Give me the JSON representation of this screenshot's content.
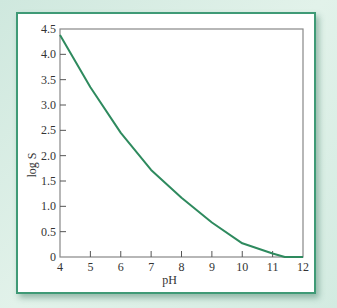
{
  "chart_data": {
    "type": "line",
    "title": "",
    "xlabel": "pH",
    "ylabel": "log S",
    "xlim": [
      4,
      12
    ],
    "ylim": [
      0,
      4.5
    ],
    "x_ticks": [
      "4",
      "5",
      "6",
      "7",
      "8",
      "9",
      "10",
      "11",
      "12"
    ],
    "y_ticks": [
      "0",
      "0.5",
      "1.0",
      "1.5",
      "2.0",
      "2.5",
      "3.0",
      "3.5",
      "4.0",
      "4.5"
    ],
    "grid": false,
    "legend": null,
    "series": [
      {
        "name": "log S",
        "color": "#2e8a5e",
        "x": [
          4,
          5,
          6,
          7,
          8,
          9,
          10,
          11,
          11.4,
          12
        ],
        "y": [
          4.38,
          3.35,
          2.45,
          1.72,
          1.17,
          0.68,
          0.27,
          0.07,
          0.0,
          0.0
        ]
      }
    ]
  },
  "colors": {
    "frame_border": "#3f9a76",
    "background": "#d6ece3",
    "axis": "#888888",
    "line": "#2e8a5e"
  }
}
